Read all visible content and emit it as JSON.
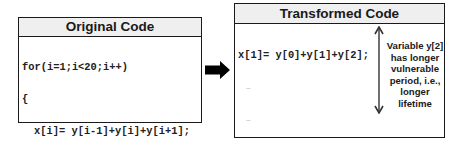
{
  "original": {
    "title": "Original Code",
    "lines": [
      {
        "text": "for(i=1;i<20;i++)",
        "indent": false,
        "type": "code"
      },
      {
        "text": "{",
        "indent": false,
        "type": "code"
      },
      {
        "text": "x[i]= y[i-1]+y[i]+y[i+1];",
        "indent": true,
        "type": "code"
      },
      {
        "text": "…",
        "indent": true,
        "type": "ellipsis"
      },
      {
        "text": "…",
        "indent": true,
        "type": "ellipsis"
      },
      {
        "text": "y[i]= y[i]+",
        "suffix": "…",
        "indent": true,
        "type": "code"
      },
      {
        "text": "}",
        "indent": false,
        "type": "code"
      }
    ]
  },
  "transformed": {
    "title": "Transformed Code",
    "lines": [
      {
        "text": "x[1]= y[0]+y[1]+y[2];",
        "indent": false,
        "type": "code"
      },
      {
        "text": "…",
        "indent": true,
        "type": "ellipsis"
      },
      {
        "text": "…",
        "indent": true,
        "type": "ellipsis"
      },
      {
        "text": "y[1]= y[1]",
        "suffix": "…",
        "indent": false,
        "type": "code"
      },
      {
        "text": "x[2]= y[1]+y[2]+y[3];",
        "indent": false,
        "type": "code"
      },
      {
        "text": "…",
        "indent": true,
        "type": "ellipsis"
      },
      {
        "text": "…",
        "indent": true,
        "type": "ellipsis"
      },
      {
        "text": "y[2]= y[2]",
        "suffix": "…",
        "indent": false,
        "type": "code"
      },
      {
        "text": "…",
        "indent": true,
        "type": "ellipsis"
      },
      {
        "text": "}",
        "indent": false,
        "type": "code"
      }
    ]
  },
  "annotation": {
    "lines": [
      "Variable y[2]",
      "has longer",
      "vulnerable",
      "period, i.e.,",
      "longer",
      "lifetime"
    ]
  },
  "icons": {
    "transform_arrow": "right-arrow-icon",
    "lifetime_arrow": "double-headed-vertical-arrow-icon"
  },
  "colors": {
    "border": "#1a1a1a",
    "header_bg": "#efefef",
    "arrow": "#000000"
  }
}
